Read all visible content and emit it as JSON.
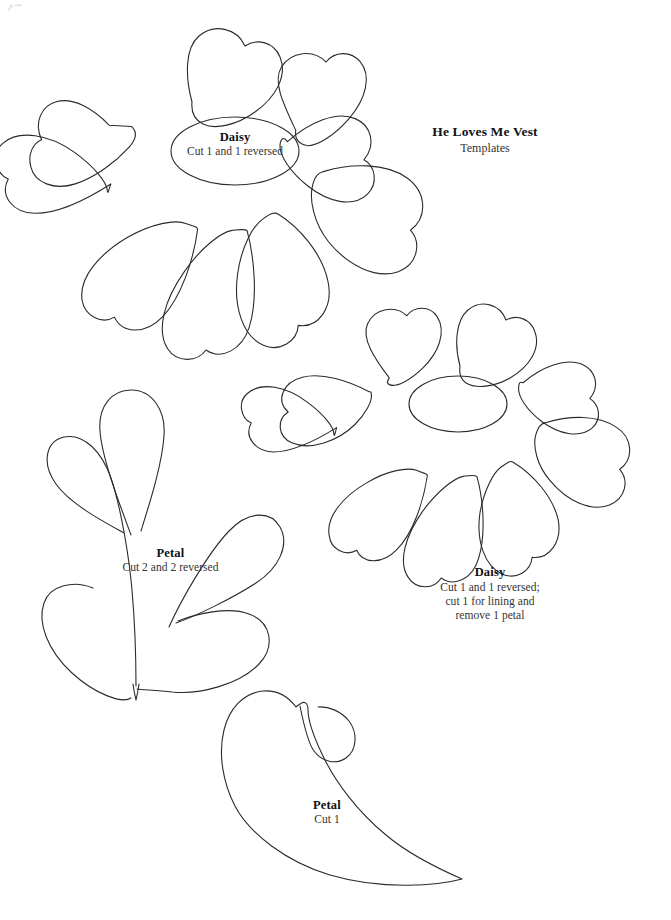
{
  "page": {
    "background_color": "#ffffff",
    "ink_color": "#2b2b2b",
    "heading_color": "#111111",
    "body_color": "#333333",
    "width": 671,
    "height": 920
  },
  "title_block": {
    "title": "He Loves Me Vest",
    "subtitle": "Templates"
  },
  "templates": [
    {
      "id": "daisy-large",
      "name": "Daisy",
      "instructions": [
        "Cut 1 and 1 reversed"
      ],
      "petal_count": 8,
      "label_position": "center"
    },
    {
      "id": "petal-compound",
      "name": "Petal",
      "instructions": [
        "Cut 2 and 2 reversed"
      ],
      "label_position": "center"
    },
    {
      "id": "daisy-small",
      "name": "Daisy",
      "instructions": [
        "Cut 1 and 1 reversed;",
        "cut 1 for lining and",
        "remove 1 petal"
      ],
      "petal_count": 8,
      "label_position": "below"
    },
    {
      "id": "petal-single",
      "name": "Petal",
      "instructions": [
        "Cut 1"
      ],
      "label_position": "center"
    }
  ],
  "labels": {
    "daisy_large_title": "Daisy",
    "daisy_large_line1": "Cut 1 and 1 reversed",
    "daisy_small_title": "Daisy",
    "daisy_small_line1": "Cut 1 and 1 reversed;",
    "daisy_small_line2": "cut 1 for lining and",
    "daisy_small_line3": "remove 1 petal",
    "petal_compound_title": "Petal",
    "petal_compound_line1": "Cut 2 and 2 reversed",
    "petal_single_title": "Petal",
    "petal_single_line1": "Cut 1"
  }
}
